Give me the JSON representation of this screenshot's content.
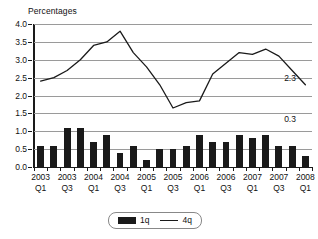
{
  "chart_data": {
    "type": "bar",
    "title": "",
    "ylabel": "Percentages",
    "xlabel": "",
    "ylim": [
      0.0,
      4.0
    ],
    "ytick_values": [
      0.0,
      0.5,
      1.0,
      1.5,
      2.0,
      2.5,
      3.0,
      3.5,
      4.0
    ],
    "ytick_labels": [
      "0.0",
      "0.5",
      "1.0",
      "1.5",
      "2.0",
      "2.5",
      "3.0",
      "3.5",
      "4.0"
    ],
    "grid": true,
    "legend_position": "bottom-center",
    "categories": [
      "2003 Q1",
      "2003 Q2",
      "2003 Q3",
      "2003 Q4",
      "2004 Q1",
      "2004 Q2",
      "2004 Q3",
      "2004 Q4",
      "2005 Q1",
      "2005 Q2",
      "2005 Q3",
      "2005 Q4",
      "2006 Q1",
      "2006 Q2",
      "2006 Q3",
      "2006 Q4",
      "2007 Q1",
      "2007 Q2",
      "2007 Q3",
      "2007 Q4",
      "2008 Q1"
    ],
    "xtick_labels": [
      {
        "index": 0,
        "line1": "2003",
        "line2": "Q1"
      },
      {
        "index": 2,
        "line1": "2003",
        "line2": "Q3"
      },
      {
        "index": 4,
        "line1": "2004",
        "line2": "Q1"
      },
      {
        "index": 6,
        "line1": "2004",
        "line2": "Q3"
      },
      {
        "index": 8,
        "line1": "2005",
        "line2": "Q1"
      },
      {
        "index": 10,
        "line1": "2005",
        "line2": "Q3"
      },
      {
        "index": 12,
        "line1": "2006",
        "line2": "Q1"
      },
      {
        "index": 14,
        "line1": "2006",
        "line2": "Q3"
      },
      {
        "index": 16,
        "line1": "2007",
        "line2": "Q1"
      },
      {
        "index": 18,
        "line1": "2007",
        "line2": "Q3"
      },
      {
        "index": 20,
        "line1": "2008",
        "line2": "Q1"
      }
    ],
    "series": [
      {
        "name": "1q",
        "type": "bar",
        "values": [
          0.6,
          0.6,
          1.1,
          1.1,
          0.7,
          0.9,
          0.4,
          0.6,
          0.2,
          0.5,
          0.5,
          0.6,
          0.9,
          0.7,
          0.7,
          0.9,
          0.8,
          0.9,
          0.6,
          0.6,
          0.3
        ]
      },
      {
        "name": "4q",
        "type": "line",
        "values": [
          2.4,
          2.5,
          2.7,
          3.0,
          3.4,
          3.5,
          3.8,
          3.2,
          2.8,
          2.3,
          1.65,
          1.8,
          1.85,
          2.6,
          2.9,
          3.2,
          3.15,
          3.3,
          3.1,
          2.7,
          2.3
        ]
      }
    ],
    "annotations": [
      {
        "name": "line-end-label",
        "text": "2.3",
        "series": "4q",
        "x_index": 19,
        "y_value": 2.3
      },
      {
        "name": "bar-end-label",
        "text": "0.3",
        "series": "1q",
        "x_index": 19,
        "y_value": 1.15
      }
    ],
    "legend": [
      {
        "label": "1q",
        "marker": "bar-swatch",
        "color": "#1a1a1a"
      },
      {
        "label": "4q",
        "marker": "line-swatch",
        "color": "#1a1a1a"
      }
    ],
    "colors": {
      "bar": "#1a1a1a",
      "line": "#1a1a1a",
      "grid": "#9a9a9a",
      "axis": "#1a1a1a",
      "background": "#ffffff"
    }
  }
}
